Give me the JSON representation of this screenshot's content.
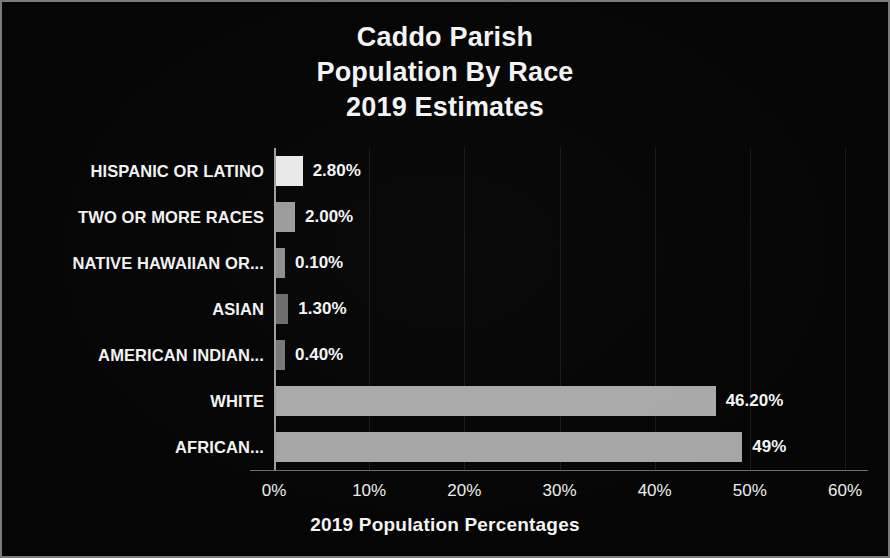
{
  "chart_data": {
    "type": "bar",
    "orientation": "horizontal",
    "title": "Caddo Parish Population By Race 2019 Estimates",
    "title_lines": [
      "Caddo Parish",
      "Population By Race",
      "2019 Estimates"
    ],
    "xlabel": "2019 Population Percentages",
    "ylabel": "",
    "xlim": [
      0,
      60
    ],
    "xtick_labels": [
      "0%",
      "10%",
      "20%",
      "30%",
      "40%",
      "50%",
      "60%"
    ],
    "xticks": [
      0,
      10,
      20,
      30,
      40,
      50,
      60
    ],
    "grid": true,
    "legend": false,
    "background_color": "#050505",
    "text_color": "#f4f4f4",
    "categories": [
      "HISPANIC OR LATINO",
      "TWO OR MORE RACES",
      "NATIVE HAWAIIAN OR...",
      "ASIAN",
      "AMERICAN INDIAN...",
      "WHITE",
      "AFRICAN..."
    ],
    "values": [
      2.8,
      2.0,
      0.1,
      1.3,
      0.4,
      46.2,
      49
    ],
    "value_labels": [
      "2.80%",
      "2.00%",
      "0.10%",
      "1.30%",
      "0.40%",
      "46.20%",
      "49%"
    ],
    "bar_colors": [
      "#e9e9e9",
      "#9c9c9c",
      "#8f8f8f",
      "#6d6d6d",
      "#787878",
      "#a9a9a9",
      "#a6a6a6"
    ],
    "bars": [
      {
        "category": "HISPANIC OR LATINO",
        "value": 2.8,
        "label": "2.80%",
        "color": "#e9e9e9"
      },
      {
        "category": "TWO OR MORE RACES",
        "value": 2.0,
        "label": "2.00%",
        "color": "#9c9c9c"
      },
      {
        "category": "NATIVE HAWAIIAN OR...",
        "value": 0.1,
        "label": "0.10%",
        "color": "#8f8f8f"
      },
      {
        "category": "ASIAN",
        "value": 1.3,
        "label": "1.30%",
        "color": "#6d6d6d"
      },
      {
        "category": "AMERICAN INDIAN...",
        "value": 0.4,
        "label": "0.40%",
        "color": "#787878"
      },
      {
        "category": "WHITE",
        "value": 46.2,
        "label": "46.20%",
        "color": "#a9a9a9"
      },
      {
        "category": "AFRICAN...",
        "value": 49,
        "label": "49%",
        "color": "#a6a6a6"
      }
    ]
  }
}
